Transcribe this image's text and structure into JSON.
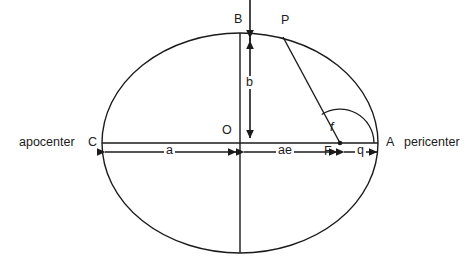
{
  "figure": {
    "type": "diagram",
    "background_color": "#ffffff",
    "stroke_color": "#1b1b1b",
    "labels": {
      "apocenter": "apocenter",
      "pericenter": "pericenter",
      "point_c": "C",
      "point_a": "A",
      "point_b": "B",
      "point_o": "O",
      "point_p": "P",
      "point_f": "F",
      "dim_a": "a",
      "dim_b": "b",
      "dim_ae": "ae",
      "dim_q": "q",
      "angle_f": "f"
    },
    "geometry": {
      "center": {
        "x": 240,
        "y": 143
      },
      "semi_major_px": 138,
      "semi_minor_px": 110,
      "vertex_c": {
        "x": 102,
        "y": 143
      },
      "vertex_a": {
        "x": 378,
        "y": 143
      },
      "covertex_b": {
        "x": 240,
        "y": 33
      },
      "focus_f": {
        "x": 340,
        "y": 143
      },
      "orbiting_body_p": {
        "x": 283,
        "y": 37
      },
      "angle_arc_radius_px": 34
    }
  }
}
